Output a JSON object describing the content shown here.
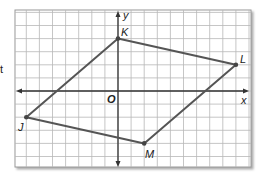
{
  "stray_text": "t",
  "figure": {
    "axes": {
      "x_label": "x",
      "y_label": "y",
      "origin_label": "O"
    },
    "grid": {
      "columns": 18,
      "rows": 12,
      "spacing_px": 13.1,
      "line_color": "#b8b8b8",
      "border_color": "#888888"
    },
    "shape": {
      "type": "parallelogram",
      "stroke_color": "#555555",
      "vertices": [
        {
          "label": "K",
          "x": 0,
          "y": 4
        },
        {
          "label": "L",
          "x": 9,
          "y": 2
        },
        {
          "label": "M",
          "x": 2,
          "y": -4
        },
        {
          "label": "J",
          "x": -7,
          "y": -2
        }
      ]
    }
  },
  "chart_data": {
    "type": "scatter",
    "title": "",
    "xlabel": "x",
    "ylabel": "y",
    "xlim": [
      -8,
      10
    ],
    "ylim": [
      -6,
      6
    ],
    "grid": true,
    "series": [
      {
        "name": "JKLM",
        "points": [
          {
            "label": "J",
            "x": -7,
            "y": -2
          },
          {
            "label": "K",
            "x": 0,
            "y": 4
          },
          {
            "label": "L",
            "x": 9,
            "y": 2
          },
          {
            "label": "M",
            "x": 2,
            "y": -4
          }
        ]
      }
    ]
  }
}
